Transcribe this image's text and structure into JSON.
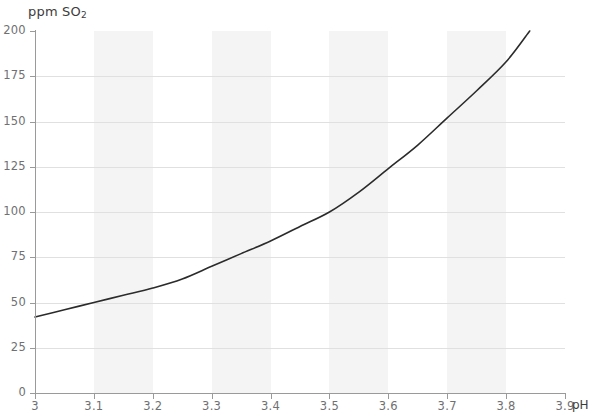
{
  "chart_data": {
    "type": "line",
    "title": "",
    "subtitle": "",
    "xlabel": "pH",
    "ylabel": "ppm SO2",
    "ylabel_display": "ppm SO",
    "ylabel_subscript": "2",
    "xlim": [
      3.0,
      3.9
    ],
    "ylim": [
      0,
      200
    ],
    "grid": "horizontal",
    "legend": "none",
    "banding": "alternating vertical shaded bands every 0.1 pH",
    "x_ticks": [
      "3",
      "3.1",
      "3.2",
      "3.3",
      "3.4",
      "3.5",
      "3.6",
      "3.7",
      "3.8",
      "3.9"
    ],
    "x_tick_values": [
      3.0,
      3.1,
      3.2,
      3.3,
      3.4,
      3.5,
      3.6,
      3.7,
      3.8,
      3.9
    ],
    "y_ticks": [
      "200",
      "175",
      "150",
      "125",
      "100",
      "75",
      "50",
      "25",
      "0"
    ],
    "y_tick_values": [
      200,
      175,
      150,
      125,
      100,
      75,
      50,
      25,
      0
    ],
    "x": [
      3.0,
      3.05,
      3.1,
      3.15,
      3.2,
      3.25,
      3.3,
      3.35,
      3.4,
      3.45,
      3.5,
      3.55,
      3.6,
      3.65,
      3.7,
      3.75,
      3.8,
      3.84
    ],
    "values": [
      42,
      46,
      50,
      54,
      58,
      63,
      70,
      77,
      84,
      92,
      100,
      111,
      124,
      137,
      152,
      167,
      183,
      200
    ],
    "series": [
      {
        "name": "molecular SO2 equivalence",
        "color": "#2b2b2b",
        "x": [
          3.0,
          3.05,
          3.1,
          3.15,
          3.2,
          3.25,
          3.3,
          3.35,
          3.4,
          3.45,
          3.5,
          3.55,
          3.6,
          3.65,
          3.7,
          3.75,
          3.8,
          3.84
        ],
        "values": [
          42,
          46,
          50,
          54,
          58,
          63,
          70,
          77,
          84,
          92,
          100,
          111,
          124,
          137,
          152,
          167,
          183,
          200
        ]
      }
    ],
    "colors": {
      "curve": "#2b2b2b",
      "gridline": "#e0e0e0",
      "axis": "#9a9a9a",
      "band": "#f4f4f4",
      "background": "#ffffff",
      "tick_label": "#6f7072",
      "axis_title": "#3c3c3b"
    }
  },
  "axes": {
    "y_title_main": "ppm SO",
    "y_title_sub": "2",
    "x_title": "pH"
  }
}
